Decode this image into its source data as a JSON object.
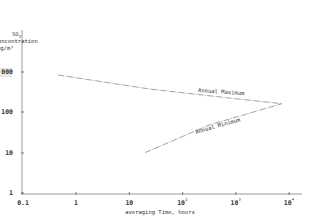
{
  "chart_data": {
    "type": "line",
    "title": "",
    "xlabel": "averaging Time, hours",
    "ylabel": [
      "SO2",
      "oncentration",
      "µg/m³"
    ],
    "xscale": "log",
    "yscale": "log",
    "xlim": [
      0.1,
      20000
    ],
    "ylim": [
      1,
      3000
    ],
    "grid": false,
    "x_ticks": [
      "0.1",
      "1",
      "10",
      "10²",
      "10³",
      "10⁴"
    ],
    "x_tick_values": [
      0.1,
      1,
      10,
      100,
      1000,
      10000
    ],
    "y_ticks": [
      "1",
      "10",
      "100",
      "000"
    ],
    "y_tick_values": [
      1,
      10,
      100,
      1000
    ],
    "series": [
      {
        "name": "Annual Maximum",
        "x": [
          0.46,
          24,
          780,
          7300
        ],
        "y": [
          820,
          370,
          220,
          160
        ]
      },
      {
        "name": "Annual Minimum",
        "x": [
          20,
          320,
          7300
        ],
        "y": [
          10,
          48,
          160
        ]
      }
    ],
    "annotations": [
      "Annual Maximum",
      "Annual Minimum"
    ]
  }
}
